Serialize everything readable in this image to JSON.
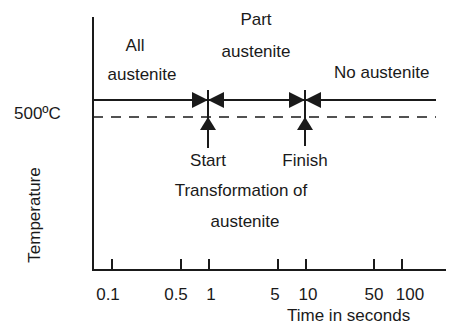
{
  "diagram": {
    "y_axis_label": "Temperature",
    "x_axis_label": "Time in seconds",
    "temperature_label": "500ºC",
    "regions": {
      "all_austenite": [
        "All",
        "austenite"
      ],
      "part_austenite": [
        "Part",
        "austenite"
      ],
      "no_austenite": "No austenite"
    },
    "markers": {
      "start": "Start",
      "finish": "Finish"
    },
    "transformation_label": [
      "Transformation of",
      "austenite"
    ],
    "x_ticks": [
      "0.1",
      "0.5",
      "1",
      "5",
      "10",
      "50",
      "100"
    ]
  }
}
